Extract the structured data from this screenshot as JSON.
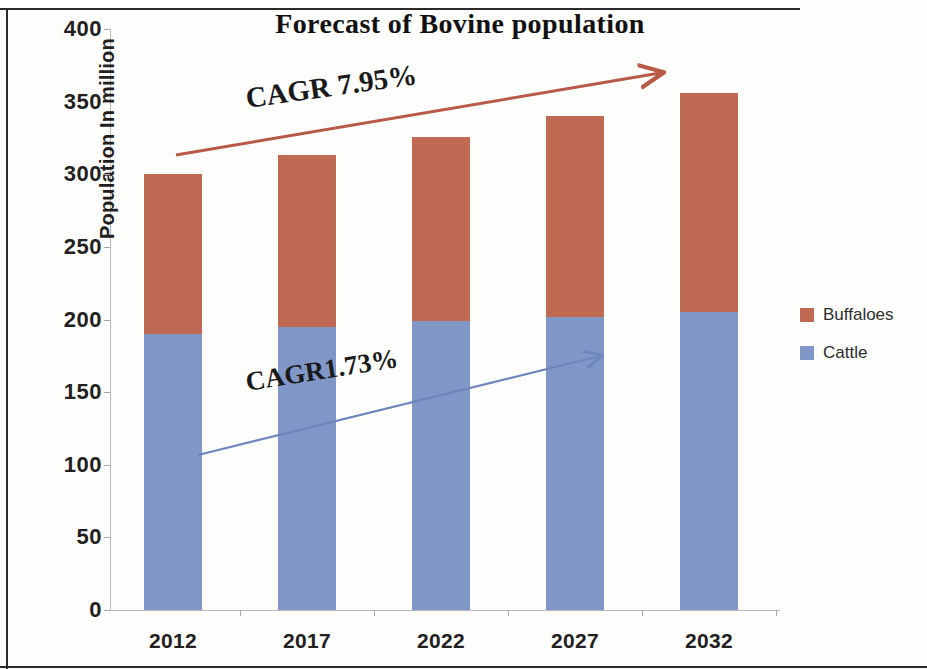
{
  "chart_data": {
    "type": "bar",
    "stacked": true,
    "title": "Forecast of Bovine population",
    "xlabel": "",
    "ylabel": "Population In million",
    "categories": [
      "2012",
      "2017",
      "2022",
      "2027",
      "2032"
    ],
    "series": [
      {
        "name": "Cattle",
        "color": "#8097c8",
        "values": [
          190,
          195,
          199,
          202,
          205
        ]
      },
      {
        "name": "Buffaloes",
        "color": "#c06a53",
        "values": [
          110,
          118,
          127,
          138,
          151
        ]
      }
    ],
    "totals": [
      300,
      313,
      326,
      340,
      356
    ],
    "ylim": [
      0,
      400
    ],
    "yticks": [
      0,
      50,
      100,
      150,
      200,
      250,
      300,
      350,
      400
    ],
    "ytick_labels": [
      "0",
      "50",
      "100",
      "150",
      "200",
      "250",
      "300",
      "350",
      "400"
    ],
    "grid": false,
    "legend_position": "right",
    "annotations": [
      {
        "text": "CAGR 7.95%",
        "series": "Buffaloes",
        "arrow_color": "#b85a47"
      },
      {
        "text": "CAGR1.73%",
        "series": "Cattle",
        "arrow_color": "#6e85bd"
      }
    ]
  },
  "chart": {
    "title": "Forecast of Bovine population",
    "y_axis_title": "Population In million",
    "y_tick_labels": [
      "400",
      "350",
      "300",
      "250",
      "200",
      "150",
      "100",
      "50",
      "0"
    ],
    "x_tick_labels": [
      "2012",
      "2017",
      "2022",
      "2027",
      "2032"
    ]
  },
  "legend": {
    "items": [
      {
        "label": "Buffaloes",
        "color": "#c06a53"
      },
      {
        "label": "Cattle",
        "color": "#8097c8"
      }
    ]
  },
  "annotations": {
    "buffaloes_cagr": "CAGR 7.95%",
    "cattle_cagr": "CAGR1.73%"
  }
}
